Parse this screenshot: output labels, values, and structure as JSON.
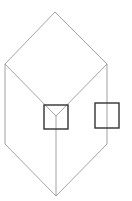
{
  "diagram": {
    "type": "isometric-cube-line-drawing",
    "stroke_color": "#8a8a8a",
    "square_stroke_color": "#333333",
    "cube": {
      "top": [
        55,
        12
      ],
      "left_top": [
        5,
        64
      ],
      "right_top": [
        107,
        64
      ],
      "center": [
        56,
        116
      ],
      "left_bottom": [
        5,
        144
      ],
      "right_bottom": [
        107,
        144
      ],
      "bottom": [
        56,
        196
      ]
    },
    "squares": [
      {
        "name": "center-square",
        "x": 44,
        "y": 105,
        "w": 24,
        "h": 24
      },
      {
        "name": "right-square",
        "x": 95,
        "y": 103,
        "w": 24,
        "h": 25
      }
    ]
  }
}
